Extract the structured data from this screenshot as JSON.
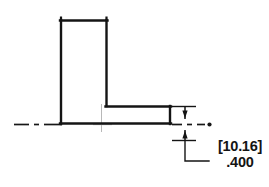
{
  "drawing": {
    "title": "L-angle cross-section detail",
    "view_type": "section",
    "background_color": "#ffffff",
    "line_color": "#141414",
    "centerline_color": "#1a1a1a",
    "construction_color": "#b0b0b0",
    "part": {
      "name": "L-shaped angle profile",
      "profile_outline_label": "angle-profile-outline",
      "vertical_leg_label": "vertical-leg",
      "horizontal_leg_label": "horizontal-leg"
    },
    "centerline": {
      "label": "horizontal-centerline",
      "style": "dash-dot",
      "secondary_label": "vertical-centerline"
    },
    "dimension": {
      "name": "thickness-dimension",
      "metric_value": "[10.16]",
      "imperial_value": ".400",
      "arrow_direction": "inward",
      "leader_style": "stepped"
    }
  }
}
